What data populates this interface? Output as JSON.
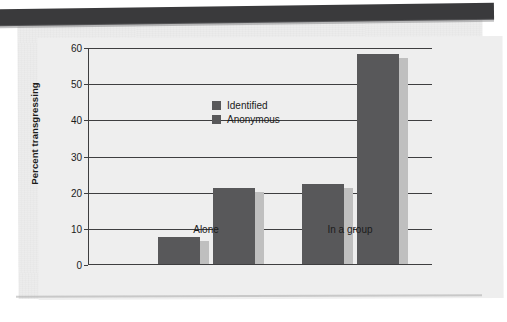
{
  "chart_data": {
    "type": "bar",
    "title": "",
    "xlabel": "",
    "ylabel": "Percent transgressing",
    "categories": [
      "Alone",
      "In a group"
    ],
    "series": [
      {
        "name": "Identified",
        "values": [
          7.5,
          22
        ],
        "color": "#58585a"
      },
      {
        "name": "Anonymous",
        "values": [
          21,
          58
        ],
        "color": "#58585a"
      }
    ],
    "ylim": [
      0,
      60
    ],
    "yticks": [
      0,
      10,
      20,
      30,
      40,
      50,
      60
    ],
    "ytick_labels": [
      "0",
      "10",
      "20",
      "30",
      "40",
      "50",
      "60"
    ],
    "grid": true,
    "legend_position": "top-left-inside"
  },
  "legend": {
    "items": [
      {
        "label": "Identified"
      },
      {
        "label": "Anonymous"
      }
    ]
  },
  "axes": {
    "y_title": "Percent transgressing",
    "x_categories": [
      "Alone",
      "In a group"
    ]
  },
  "style": {
    "bar_color": "#58585a",
    "bar_shadow_color": "#bfbfbf",
    "axis_color": "#3e3e40",
    "paper_color": "#ececec",
    "top_band_color": "#3a3a3c",
    "text_color": "#1b1b1b"
  }
}
